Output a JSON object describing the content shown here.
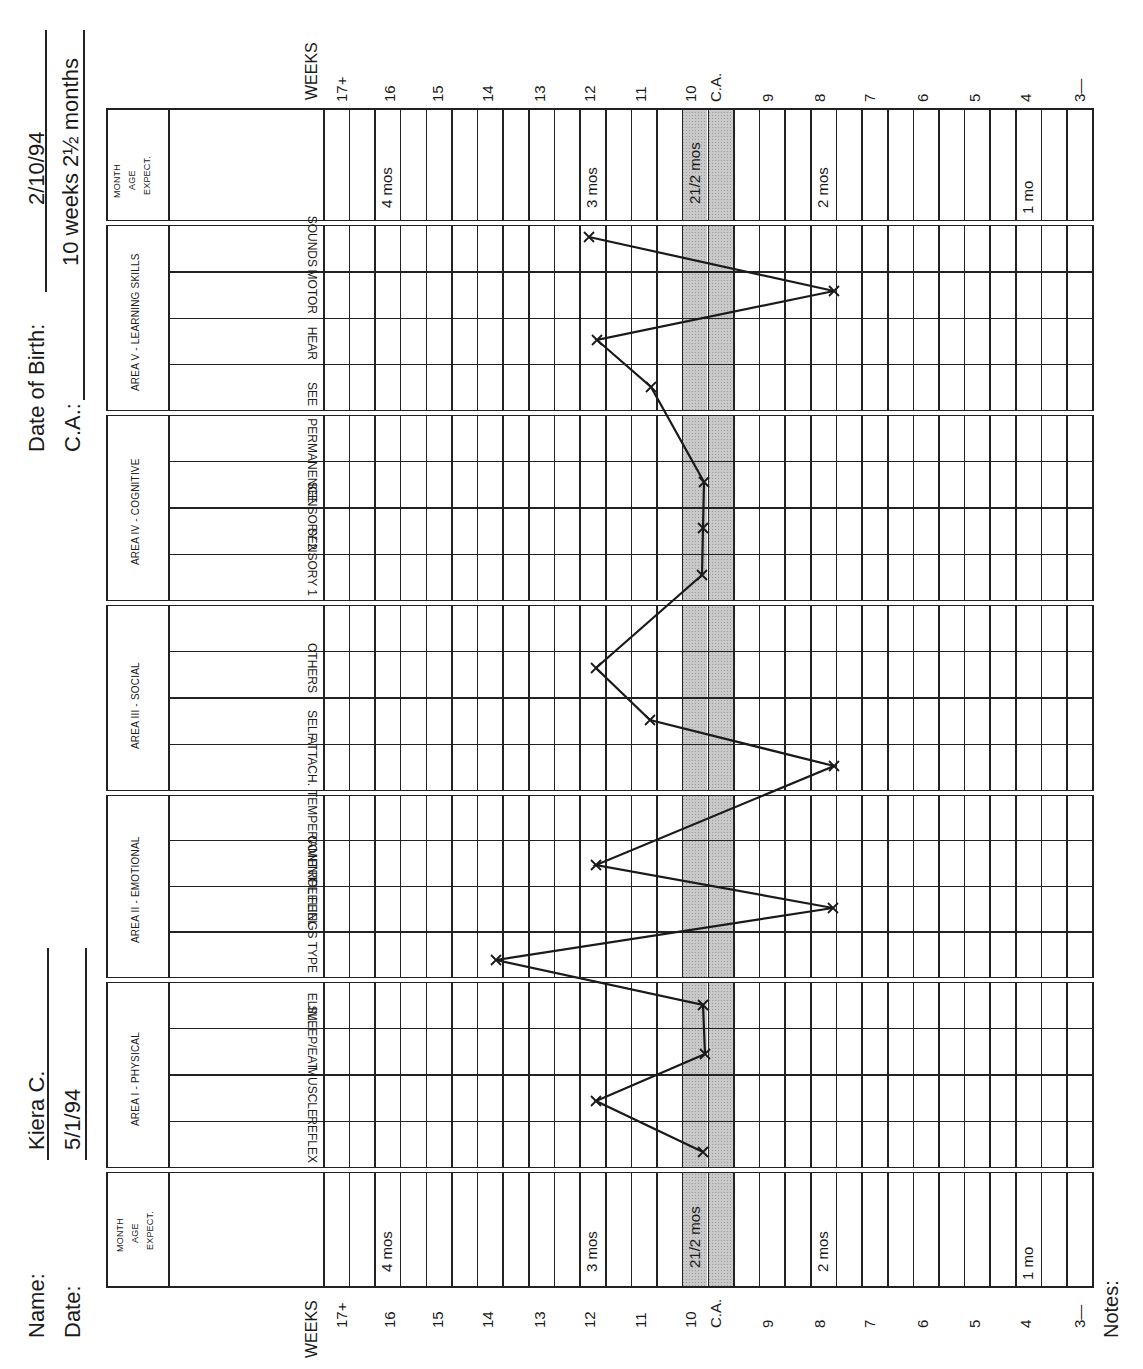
{
  "header": {
    "name_label": "Name:",
    "name_value": "Kiera C.",
    "date_label": "Date:",
    "date_value": "5/1/94",
    "dob_label": "Date of Birth:",
    "dob_value": "2/10/94",
    "ca_label": "C.A.:",
    "ca_value": "10 weeks 2½ months",
    "notes_label": "Notes:"
  },
  "band": {
    "line1": "MONTH",
    "line2": "AGE",
    "line3": "EXPECT.",
    "weeks_title": "WEEKS",
    "month_markers": [
      {
        "label": "4 mos",
        "col": 2
      },
      {
        "label": "3 mos",
        "col": 10
      },
      {
        "label": "21/2 mos",
        "col": 14
      },
      {
        "label": "2 mos",
        "col": 19
      },
      {
        "label": "1 mo",
        "col": 27
      }
    ]
  },
  "week_labels": [
    {
      "label": "17+",
      "x": 342
    },
    {
      "label": "16",
      "x": 390
    },
    {
      "label": "15",
      "x": 438
    },
    {
      "label": "14",
      "x": 488
    },
    {
      "label": "13",
      "x": 540
    },
    {
      "label": "12",
      "x": 590
    },
    {
      "label": "11",
      "x": 641
    },
    {
      "label": "10",
      "x": 691
    },
    {
      "label": "C.A.",
      "x": 716
    },
    {
      "label": "9",
      "x": 768
    },
    {
      "label": "8",
      "x": 820
    },
    {
      "label": "7",
      "x": 870
    },
    {
      "label": "6",
      "x": 923
    },
    {
      "label": "5",
      "x": 975
    },
    {
      "label": "4",
      "x": 1026
    },
    {
      "label": "3—",
      "x": 1080
    }
  ],
  "areas": [
    {
      "title": "AREA V - LEARNING SKILLS",
      "items": [
        "SOUNDS",
        "MOTOR",
        "HEAR",
        "SEE"
      ]
    },
    {
      "title": "AREA IV - COGNITIVE",
      "items": [
        "",
        "PERMANENCE",
        "SENSORY 2",
        "SENSORY 1"
      ]
    },
    {
      "title": "AREA III - SOCIAL",
      "items": [
        "",
        "OTHERS",
        "SELF",
        "ATTACH."
      ]
    },
    {
      "title": "AREA II - EMOTIONAL",
      "items": [
        "",
        "TEMPERAMENT",
        "CONTROL FEEL",
        "FEELINGS TYPE"
      ]
    },
    {
      "title": "AREA I - PHYSICAL",
      "items": [
        "ELIM.",
        "SLEEP/EAT",
        "MUSCLE",
        "REFLEX"
      ]
    }
  ],
  "colors": {
    "ink": "#1a1a1a",
    "shade": "#c9c9c9",
    "paper": "#ffffff"
  },
  "chart_data": {
    "type": "line",
    "xlabel": "WEEKS",
    "ylabel": "Skill areas",
    "axis_ticks": [
      "17+",
      "16",
      "15",
      "14",
      "13",
      "12",
      "11",
      "10",
      "C.A.",
      "9",
      "8",
      "7",
      "6",
      "5",
      "4",
      "3"
    ],
    "ca_marker": {
      "label": "C.A.",
      "weeks": 10,
      "month_label": "21/2 mos"
    },
    "month_expectations": [
      {
        "label": "4 mos",
        "weeks": 16
      },
      {
        "label": "3 mos",
        "weeks": 12
      },
      {
        "label": "21/2 mos",
        "weeks": 10
      },
      {
        "label": "2 mos",
        "weeks": 8
      },
      {
        "label": "1 mo",
        "weeks": 4
      }
    ],
    "categories": [
      "SOUNDS",
      "MOTOR",
      "HEAR",
      "SEE",
      "PERMANENCE",
      "SENSORY 2",
      "SENSORY 1",
      "OTHERS",
      "SELF",
      "ATTACH.",
      "TEMPERAMENT",
      "CONTROL FEEL",
      "FEELINGS TYPE",
      "ELIM.",
      "SLEEP/EAT",
      "MUSCLE",
      "REFLEX"
    ],
    "series": [
      {
        "name": "Kiera C.",
        "values": [
          12,
          8,
          12,
          11,
          10,
          10,
          10,
          12,
          11,
          8,
          12,
          8,
          14,
          10,
          10,
          12,
          10
        ]
      }
    ],
    "points_px": [
      {
        "item": "SOUNDS",
        "x": 589,
        "y": 237
      },
      {
        "item": "MOTOR",
        "x": 834,
        "y": 291
      },
      {
        "item": "HEAR",
        "x": 597,
        "y": 340
      },
      {
        "item": "SEE",
        "x": 651,
        "y": 387
      },
      {
        "item": "PERMANENCE",
        "x": 704,
        "y": 482
      },
      {
        "item": "SENSORY 2",
        "x": 703,
        "y": 528
      },
      {
        "item": "SENSORY 1",
        "x": 702,
        "y": 575
      },
      {
        "item": "OTHERS",
        "x": 596,
        "y": 668
      },
      {
        "item": "SELF",
        "x": 650,
        "y": 720
      },
      {
        "item": "ATTACH.",
        "x": 834,
        "y": 766
      },
      {
        "item": "TEMPERAMENT",
        "x": 596,
        "y": 865
      },
      {
        "item": "CONTROL FEEL",
        "x": 833,
        "y": 908
      },
      {
        "item": "FEELINGS TYPE",
        "x": 496,
        "y": 960
      },
      {
        "item": "ELIM.",
        "x": 703,
        "y": 1005
      },
      {
        "item": "SLEEP/EAT",
        "x": 705,
        "y": 1054
      },
      {
        "item": "MUSCLE",
        "x": 596,
        "y": 1101
      },
      {
        "item": "REFLEX",
        "x": 703,
        "y": 1152
      }
    ]
  }
}
